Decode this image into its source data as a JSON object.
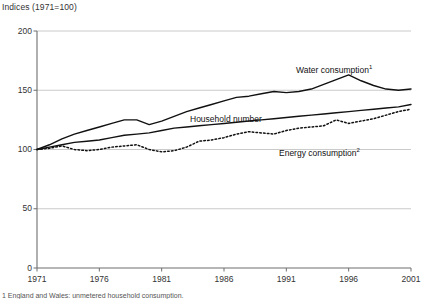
{
  "chart_data": {
    "type": "line",
    "title": "Indices (1971=100)",
    "ylabel": "",
    "xlabel": "",
    "ylim": [
      0,
      200
    ],
    "xlim": [
      1971,
      2001
    ],
    "yticks": [
      0,
      50,
      100,
      150,
      200
    ],
    "xticks": [
      1971,
      1976,
      1981,
      1986,
      1991,
      1996,
      2001
    ],
    "grid": true,
    "legend_position": "inline-annotations",
    "x": [
      1971,
      1972,
      1973,
      1974,
      1975,
      1976,
      1977,
      1978,
      1979,
      1980,
      1981,
      1982,
      1983,
      1984,
      1985,
      1986,
      1987,
      1988,
      1989,
      1990,
      1991,
      1992,
      1993,
      1994,
      1995,
      1996,
      1997,
      1998,
      1999,
      2000,
      2001
    ],
    "series": [
      {
        "name": "Water consumption",
        "footnote_marker": "1",
        "style": "solid",
        "color": "#111111",
        "values": [
          100,
          104,
          109,
          113,
          116,
          119,
          122,
          125,
          125,
          121,
          124,
          128,
          132,
          135,
          138,
          141,
          144,
          145,
          147,
          149,
          148,
          149,
          151,
          155,
          159,
          163,
          158,
          154,
          151,
          150,
          151
        ]
      },
      {
        "name": "Household number",
        "footnote_marker": "",
        "style": "solid",
        "color": "#111111",
        "values": [
          100,
          102,
          104,
          106,
          107,
          108,
          110,
          112,
          113,
          114,
          116,
          118,
          119,
          120,
          121,
          122,
          123,
          124,
          125,
          126,
          127,
          128,
          129,
          130,
          131,
          132,
          133,
          134,
          135,
          136,
          138
        ]
      },
      {
        "name": "Energy consumption",
        "footnote_marker": "2",
        "style": "dotted",
        "color": "#111111",
        "values": [
          100,
          101,
          103,
          100,
          99,
          100,
          102,
          103,
          104,
          100,
          98,
          99,
          102,
          107,
          108,
          110,
          113,
          115,
          114,
          113,
          116,
          118,
          119,
          120,
          125,
          122,
          124,
          126,
          129,
          132,
          134
        ]
      }
    ],
    "annotations": [
      {
        "text": "Water consumption",
        "marker": "1",
        "x_px": 296,
        "y_px": 64
      },
      {
        "text": "Household number",
        "marker": "",
        "x_px": 190,
        "y_px": 114
      },
      {
        "text": "Energy consumption",
        "marker": "2",
        "x_px": 279,
        "y_px": 147
      }
    ]
  },
  "footnote": "1 England and Wales: unmetered household consumption."
}
